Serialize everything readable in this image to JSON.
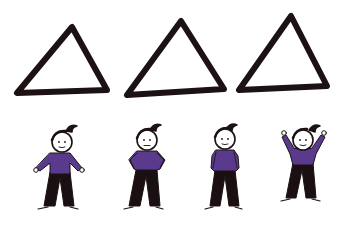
{
  "colors": {
    "ink": "#1c1214",
    "shirt": "#5a3a8c",
    "pants": "#1a1012",
    "skin": "#ffffff",
    "background": "#ffffff"
  },
  "triangles": [
    {
      "id": 1,
      "points": "72,27 17,93 107,90"
    },
    {
      "id": 2,
      "points": "181,21 127,95 224,89"
    },
    {
      "id": 3,
      "points": "291,16 239,90 327,86"
    }
  ],
  "figures": [
    {
      "id": 1,
      "pose": "arms-out-sideways",
      "expression": "smile"
    },
    {
      "id": 2,
      "pose": "hands-on-hips",
      "expression": "neutral"
    },
    {
      "id": 3,
      "pose": "hands-in-pockets",
      "expression": "smile"
    },
    {
      "id": 4,
      "pose": "arms-raised",
      "expression": "smile"
    }
  ],
  "caption": "Three outlined triangles above four cartoon figures in different poses"
}
